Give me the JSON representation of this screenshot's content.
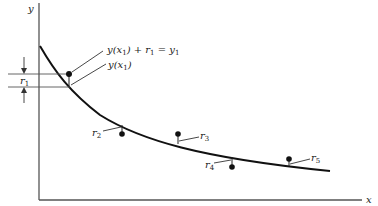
{
  "figure": {
    "type": "diagram",
    "axes": {
      "x_label": "x",
      "y_label": "y"
    },
    "annotations": {
      "point_label": "y(x",
      "point_label_sub": "1",
      "point_label_rest": ") + r",
      "point_label_sub2": "1",
      "point_label_eq": " = y",
      "point_label_sub3": "1",
      "curve_label": "y(x",
      "curve_label_sub": "1",
      "curve_label_end": ")",
      "r1_label": "r",
      "r1_sub": "1"
    },
    "residuals": [
      {
        "name": "r",
        "sub": "1"
      },
      {
        "name": "r",
        "sub": "2"
      },
      {
        "name": "r",
        "sub": "3"
      },
      {
        "name": "r",
        "sub": "4"
      },
      {
        "name": "r",
        "sub": "5"
      }
    ]
  }
}
